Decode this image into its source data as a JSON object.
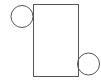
{
  "diagram": {
    "stroke_color": "#555555",
    "fill_color": "#ffffff",
    "rectangle": {
      "x": 33,
      "y": 4,
      "width": 45,
      "height": 72
    },
    "circles": [
      {
        "name": "top-left-circle",
        "cx": 22,
        "cy": 16.5,
        "r": 11
      },
      {
        "name": "bottom-right-circle",
        "cx": 88.5,
        "cy": 64,
        "r": 11
      }
    ]
  }
}
